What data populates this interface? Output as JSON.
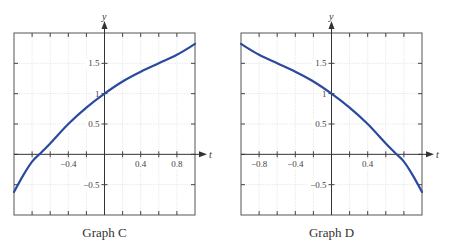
{
  "chart_data": [
    {
      "type": "line",
      "title": "Graph C",
      "xlabel": "t",
      "ylabel": "y",
      "xlim": [
        -1,
        1
      ],
      "ylim": [
        -1,
        2
      ],
      "grid": true,
      "x_tick_labels": [
        "-0.4",
        "0.4",
        "0.8"
      ],
      "x_tick_label_values": [
        -0.4,
        0.4,
        0.8
      ],
      "y_tick_labels": [
        "1.5",
        "1",
        "0.5",
        "-0.5"
      ],
      "y_tick_label_values": [
        1.5,
        1,
        0.5,
        -0.5
      ],
      "series": [
        {
          "name": "Graph C curve",
          "color": "#2b4a9e",
          "x": [
            -1,
            -0.9,
            -0.8,
            -0.72,
            -0.6,
            -0.4,
            -0.2,
            0,
            0.2,
            0.4,
            0.6,
            0.8,
            1
          ],
          "y": [
            -0.62,
            -0.35,
            -0.12,
            0,
            0.18,
            0.5,
            0.77,
            1,
            1.2,
            1.36,
            1.5,
            1.64,
            1.82
          ]
        }
      ]
    },
    {
      "type": "line",
      "title": "Graph D",
      "xlabel": "t",
      "ylabel": "y",
      "xlim": [
        -1,
        1
      ],
      "ylim": [
        -1,
        2
      ],
      "grid": true,
      "x_tick_labels": [
        "-0.8",
        "-0.4",
        "0.4"
      ],
      "x_tick_label_values": [
        -0.8,
        -0.4,
        0.4
      ],
      "y_tick_labels": [
        "1.5",
        "1",
        "0.5",
        "-0.5"
      ],
      "y_tick_label_values": [
        1.5,
        1,
        0.5,
        -0.5
      ],
      "series": [
        {
          "name": "Graph D curve",
          "color": "#2b4a9e",
          "x": [
            -1,
            -0.8,
            -0.6,
            -0.4,
            -0.2,
            0,
            0.2,
            0.4,
            0.6,
            0.72,
            0.8,
            0.9,
            1
          ],
          "y": [
            1.82,
            1.64,
            1.5,
            1.36,
            1.2,
            1,
            0.77,
            0.5,
            0.18,
            0,
            -0.12,
            -0.35,
            -0.62
          ]
        }
      ]
    }
  ],
  "graphs": {
    "c": {
      "caption": "Graph C",
      "x_axis_name": "t",
      "y_axis_name": "y"
    },
    "d": {
      "caption": "Graph D",
      "x_axis_name": "t",
      "y_axis_name": "y"
    }
  }
}
